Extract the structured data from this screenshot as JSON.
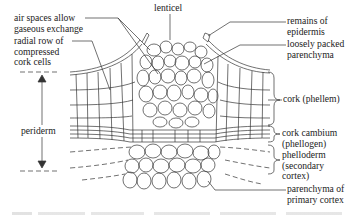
{
  "diagram": {
    "labels": {
      "air_spaces": [
        "air spaces allow",
        "gaseous exchange"
      ],
      "radial_row": [
        "radial row of",
        "compressed",
        "cork cells"
      ],
      "lenticel": "lenticel",
      "remains_epidermis": [
        "remains of",
        "epidermis"
      ],
      "loosely_packed": [
        "loosely packed",
        "parenchyma"
      ],
      "cork": "cork (phellem)",
      "cork_cambium": [
        "cork cambium",
        "(phellogen)"
      ],
      "phelloderm": [
        "phelloderm",
        "(secondary",
        "cortex)"
      ],
      "parenchyma_primary": [
        "parenchyma of",
        "primary cortex"
      ],
      "periderm": "periderm"
    },
    "colors": {
      "line": "#333333",
      "text": "#222222",
      "background": "#ffffff"
    }
  }
}
